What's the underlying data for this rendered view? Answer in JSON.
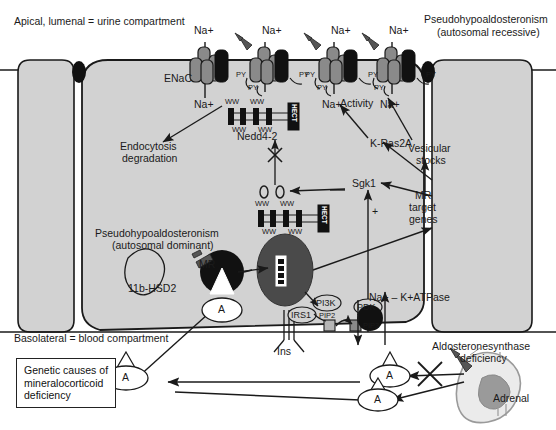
{
  "figure": {
    "colors": {
      "cell_fill": "#d2d2d2",
      "outline": "#1a1a1a",
      "channel_dark": "#1a1a1a",
      "channel_grey": "#8a8a8a",
      "nucleus": "#4a4a4a",
      "adrenal_outline": "#9a9a9a",
      "adrenal_inner": "#9a9a9a",
      "background": "#ffffff"
    }
  },
  "compartments": {
    "apical_label": "Apical, lumenal = urine compartment",
    "basolateral_label": "Basolateral = blood compartment"
  },
  "disease_callouts": {
    "autosomal_recessive_line1": "Pseudohypoaldosteronism",
    "autosomal_recessive_line2": "(autosomal recessive)",
    "autosomal_dominant_line1": "Pseudohypoaldosteronism",
    "autosomal_dominant_line2": "(autosomal dominant)",
    "aldosterone_synthase_line1": "Aldosteronesynthase",
    "aldosterone_synthase_line2": "deficiency"
  },
  "legend": {
    "line1": "Genetic causes of",
    "line2": "mineralocorticoid",
    "line3": "deficiency"
  },
  "ions": {
    "na_out_1": "Na+",
    "na_in_1": "Na+",
    "na_out_2": "Na+",
    "na_out_3": "Na+",
    "na_in_3": "Na+",
    "na_out_4": "Na+",
    "na_in_4": "Na+"
  },
  "proteins": {
    "enac": "ENaC",
    "nedd4_2": "Nedd4-2",
    "hect_1": "HECT",
    "hect_2": "HECT",
    "ww_labels": [
      "WW",
      "WW",
      "WW",
      "WW"
    ],
    "ww_labels_2": [
      "WW",
      "WW",
      "WW",
      "WW"
    ],
    "py_labels": [
      "PY",
      "PY",
      "PY",
      "PY",
      "PY",
      "PY"
    ],
    "sgk1": "Sgk1",
    "k_ras2a": "K-Ras2A",
    "pdk": "PDK",
    "irs1": "IRS1",
    "pi3k": "PI3K",
    "pip2": "PIP2",
    "pip3": "PIP3",
    "ins": "Ins",
    "mr": "MR",
    "hsd2": "11b-HSD2",
    "na_k_atpase": "Na+ – K+ATPase",
    "aldosterone": "A"
  },
  "processes": {
    "endocytosis_line1": "Endocytosis",
    "endocytosis_line2": "degradation",
    "activity": "Activity",
    "vesicular_line1": "Vesicular",
    "vesicular_line2": "stocks",
    "mr_target_line1": "MR",
    "mr_target_line2": "target",
    "mr_target_line3": "genes",
    "plus_sign": "+"
  },
  "organs": {
    "adrenal": "Adrenal"
  },
  "aldosterone_molecules": [
    {
      "id": "a-mr-bound",
      "label": "A"
    },
    {
      "id": "a-blood-left",
      "label": "A"
    },
    {
      "id": "a-blood-mid-upper",
      "label": "A"
    },
    {
      "id": "a-blood-mid-lower",
      "label": "A"
    }
  ]
}
